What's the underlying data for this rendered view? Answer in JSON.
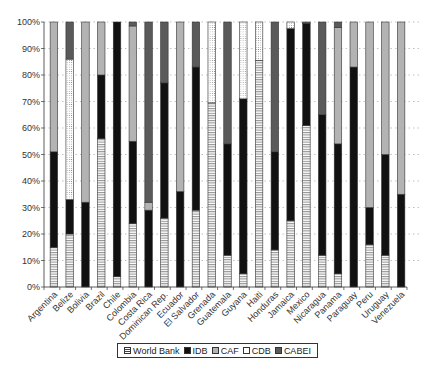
{
  "chart_data": {
    "type": "bar",
    "stacked": true,
    "normalized": true,
    "title": "",
    "xlabel": "",
    "ylabel": "",
    "ylim": [
      0,
      100
    ],
    "yticks": [
      "0%",
      "10%",
      "20%",
      "30%",
      "40%",
      "50%",
      "60%",
      "70%",
      "80%",
      "90%",
      "100%"
    ],
    "grid": "horizontal dotted",
    "legend_position": "bottom",
    "categories": [
      "Argentina",
      "Belize",
      "Bolivia",
      "Brazil",
      "Chile",
      "Colombia",
      "Costa Rica",
      "Dominican Rep.",
      "Ecuador",
      "El Salvador",
      "Grenada",
      "Guatemala",
      "Guyana",
      "Haiti",
      "Honduras",
      "Jamaica",
      "Mexico",
      "Nicaragua",
      "Panama",
      "Paraguay",
      "Peru",
      "Uruguay",
      "Venezuela"
    ],
    "series": [
      {
        "name": "World Bank",
        "pattern": "hlines",
        "color": "#ffffff",
        "values": [
          15,
          20,
          0,
          56,
          4,
          24,
          0,
          26,
          0,
          29,
          69.5,
          12,
          5,
          85.5,
          14,
          25,
          61,
          12,
          5,
          0,
          16,
          12,
          0
        ]
      },
      {
        "name": "IDB",
        "pattern": "solid",
        "color": "#111111",
        "values": [
          36,
          13,
          32,
          24,
          96,
          31,
          29,
          51,
          36,
          54,
          0,
          42,
          66,
          0,
          37,
          72.5,
          38.5,
          53,
          49,
          83,
          14,
          38,
          35
        ]
      },
      {
        "name": "CAF",
        "pattern": "solid",
        "color": "#b3b3b3",
        "values": [
          49,
          0,
          68,
          20,
          0,
          43.5,
          3,
          0,
          64,
          0,
          0,
          0,
          0,
          0,
          0,
          0,
          0,
          0,
          44,
          17,
          70,
          50,
          65
        ]
      },
      {
        "name": "CDB",
        "pattern": "dots",
        "color": "#ffffff",
        "values": [
          0,
          53,
          0,
          0,
          0,
          0,
          0,
          0,
          0,
          0,
          30.5,
          0,
          29,
          14.5,
          0,
          2.5,
          0,
          0,
          0,
          0,
          0,
          0,
          0
        ]
      },
      {
        "name": "CABEI",
        "pattern": "solid",
        "color": "#5a5a5a",
        "values": [
          0,
          14,
          0,
          0,
          0,
          1.5,
          68,
          23,
          0,
          17,
          0,
          46,
          0,
          0,
          49,
          0,
          0.5,
          35,
          2,
          0,
          0,
          0,
          0
        ]
      }
    ]
  },
  "legend": {
    "items": [
      {
        "label": "World Bank",
        "key": "wb"
      },
      {
        "label": "IDB",
        "key": "idb"
      },
      {
        "label": "CAF",
        "key": "caf"
      },
      {
        "label": "CDB",
        "key": "cdb"
      },
      {
        "label": "CABEI",
        "key": "cabei"
      }
    ]
  }
}
